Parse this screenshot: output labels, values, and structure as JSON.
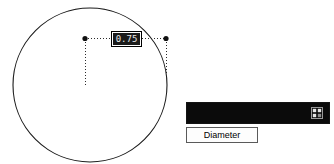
{
  "app": {
    "kind": "cad-dimension-editor"
  },
  "drawing": {
    "shape_name": "circle",
    "circle": {
      "cx": 90,
      "cy": 85,
      "r": 77
    },
    "dimension": {
      "type": "diameter",
      "value_text": "0.75",
      "selected": true,
      "extension_start": {
        "x": 85,
        "y": 38
      },
      "extension_end": {
        "x": 166,
        "y": 39
      },
      "leader_drop_left": {
        "x": 85,
        "y": 85
      },
      "leader_drop_right": {
        "x": 166,
        "y": 72
      }
    }
  },
  "value_field": {
    "name": "dimension-value-input",
    "value": "0.75",
    "placeholder": "0.00"
  },
  "palette": {
    "name": "dimension-toolbar",
    "label": "",
    "icon": "grid-window-icon"
  },
  "diameter_label": {
    "text": "Diameter"
  },
  "colors": {
    "background": "#ffffff",
    "stroke": "#1a1a1a",
    "palette_bg": "#0b0b0b",
    "palette_text": "#1e1e1e",
    "field_highlight": "#1a1a1a",
    "field_text": "#e8e8e8",
    "button_border": "#5a5a5a"
  }
}
